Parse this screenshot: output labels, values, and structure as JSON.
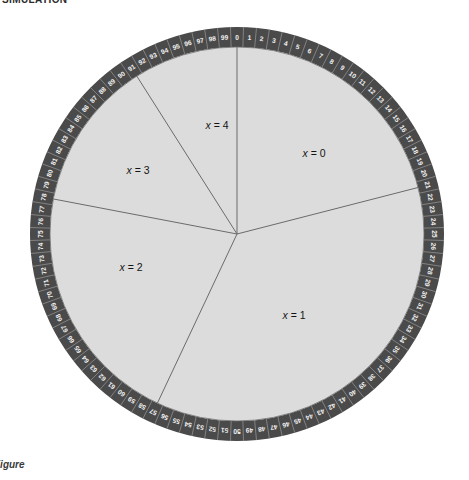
{
  "header": {
    "label": "SIMULATION"
  },
  "footer": {
    "label": "Figure"
  },
  "chart_data": {
    "type": "pie",
    "title": "SIMULATION",
    "subtitle": "",
    "xlabel": "",
    "ylabel": "",
    "wheel": {
      "center_x": 211,
      "center_y": 211,
      "outer_radius": 207,
      "rim_thickness": 20,
      "tick_count": 100,
      "tick_start_label": "0",
      "tick_end_label": "99",
      "tick_direction": "clockwise",
      "tick_labels": [
        "0",
        "1",
        "2",
        "3",
        "4",
        "5",
        "6",
        "7",
        "8",
        "9",
        "10",
        "11",
        "12",
        "13",
        "14",
        "15",
        "16",
        "17",
        "18",
        "19",
        "20",
        "21",
        "22",
        "23",
        "24",
        "25",
        "26",
        "27",
        "28",
        "29",
        "30",
        "31",
        "32",
        "33",
        "34",
        "35",
        "36",
        "37",
        "38",
        "39",
        "40",
        "41",
        "42",
        "43",
        "44",
        "45",
        "46",
        "47",
        "48",
        "49",
        "50",
        "51",
        "52",
        "53",
        "54",
        "55",
        "56",
        "57",
        "58",
        "59",
        "60",
        "61",
        "62",
        "63",
        "64",
        "65",
        "66",
        "67",
        "68",
        "69",
        "70",
        "71",
        "72",
        "73",
        "74",
        "75",
        "76",
        "77",
        "78",
        "79",
        "80",
        "81",
        "82",
        "83",
        "84",
        "85",
        "86",
        "87",
        "88",
        "89",
        "90",
        "91",
        "92",
        "93",
        "94",
        "95",
        "96",
        "97",
        "98",
        "99"
      ]
    },
    "categories": [
      "x = 0",
      "x = 1",
      "x = 2",
      "x = 3",
      "x = 4"
    ],
    "values": [
      21,
      36,
      21,
      13,
      9
    ],
    "series": [
      {
        "name": "probability",
        "values": [
          0.21,
          0.36,
          0.21,
          0.13,
          0.09
        ]
      }
    ],
    "sectors": [
      {
        "label": "x = 0",
        "var": "x",
        "eq": "= 0",
        "start_tick": 0,
        "end_tick": 21,
        "span_ticks": 21,
        "start_angle_deg": 0,
        "end_angle_deg": 75.6,
        "label_x": 288,
        "label_y": 130,
        "fill": "#dcdcdc"
      },
      {
        "label": "x = 1",
        "var": "x",
        "eq": "= 1",
        "start_tick": 21,
        "end_tick": 57,
        "span_ticks": 36,
        "start_angle_deg": 75.6,
        "end_angle_deg": 205.2,
        "label_x": 268,
        "label_y": 292,
        "fill": "#dcdcdc"
      },
      {
        "label": "x = 2",
        "var": "x",
        "eq": "= 2",
        "start_tick": 57,
        "end_tick": 78,
        "span_ticks": 21,
        "start_angle_deg": 205.2,
        "end_angle_deg": 280.8,
        "label_x": 105,
        "label_y": 244,
        "fill": "#dcdcdc"
      },
      {
        "label": "x = 3",
        "var": "x",
        "eq": "= 3",
        "start_tick": 78,
        "end_tick": 91,
        "span_ticks": 13,
        "start_angle_deg": 280.8,
        "end_angle_deg": 327.6,
        "label_x": 112,
        "label_y": 147,
        "fill": "#dcdcdc"
      },
      {
        "label": "x = 4",
        "var": "x",
        "eq": "= 4",
        "start_tick": 91,
        "end_tick": 100,
        "span_ticks": 9,
        "start_angle_deg": 327.6,
        "end_angle_deg": 360,
        "label_x": 191,
        "label_y": 102,
        "fill": "#dcdcdc"
      }
    ],
    "colors": {
      "rim": "#4a4a4a",
      "rim_tick_line": "#9a9a9a",
      "disk": "#dcdcdc",
      "sector_line": "#6b6b6b",
      "tick_text": "#f2f2f2",
      "label_text": "#141414",
      "background": "#ffffff"
    },
    "legend_position": "none",
    "grid": false
  }
}
